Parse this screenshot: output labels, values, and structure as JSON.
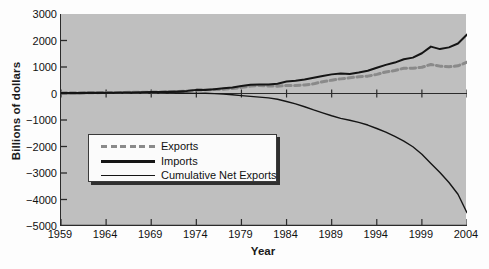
{
  "chart_data": {
    "type": "line",
    "title": "",
    "xlabel": "Year",
    "ylabel": "Billions of dollars",
    "xlim": [
      1959,
      2004
    ],
    "ylim": [
      -5000,
      3000
    ],
    "grid": false,
    "legend_position": "center-left-inside",
    "yticks": [
      3000,
      2000,
      1000,
      0,
      -1000,
      -2000,
      -3000,
      -4000,
      -5000
    ],
    "ytick_labels": [
      "3000",
      "2000",
      "1000",
      "0",
      "−1000",
      "−2000",
      "−3000",
      "−4000",
      "−5000"
    ],
    "xticks": [
      1959,
      1964,
      1969,
      1974,
      1979,
      1984,
      1989,
      1994,
      1999,
      2004
    ],
    "xtick_labels": [
      "1959",
      "1964",
      "1969",
      "1974",
      "1979",
      "1984",
      "1989",
      "1994",
      "1999",
      "2004"
    ],
    "x": [
      1959,
      1960,
      1961,
      1962,
      1963,
      1964,
      1965,
      1966,
      1967,
      1968,
      1969,
      1970,
      1971,
      1972,
      1973,
      1974,
      1975,
      1976,
      1977,
      1978,
      1979,
      1980,
      1981,
      1982,
      1983,
      1984,
      1985,
      1986,
      1987,
      1988,
      1989,
      1990,
      1991,
      1992,
      1993,
      1994,
      1995,
      1996,
      1997,
      1998,
      1999,
      2000,
      2001,
      2002,
      2003,
      2004
    ],
    "series": [
      {
        "name": "Exports",
        "style": "dashed",
        "color": "#8a8a8a",
        "values": [
          21,
          26,
          27,
          29,
          31,
          36,
          38,
          42,
          44,
          49,
          53,
          60,
          64,
          71,
          95,
          127,
          139,
          150,
          159,
          187,
          231,
          281,
          305,
          283,
          277,
          303,
          303,
          321,
          364,
          445,
          504,
          552,
          594,
          633,
          655,
          721,
          813,
          868,
          954,
          953,
          992,
          1096,
          1033,
          1006,
          1046,
          1179
        ]
      },
      {
        "name": "Imports",
        "style": "solid-thick",
        "color": "#151515",
        "values": [
          23,
          23,
          23,
          25,
          27,
          29,
          33,
          38,
          41,
          49,
          54,
          60,
          66,
          79,
          99,
          137,
          133,
          163,
          196,
          229,
          282,
          334,
          343,
          335,
          368,
          456,
          484,
          530,
          594,
          663,
          722,
          759,
          735,
          789,
          858,
          974,
          1081,
          1167,
          1294,
          1354,
          1519,
          1769,
          1676,
          1741,
          1886,
          2224
        ]
      },
      {
        "name": "Cumulative Net Exports",
        "style": "solid-thin",
        "color": "#151515",
        "values": [
          -2,
          -1,
          2,
          6,
          10,
          17,
          22,
          26,
          29,
          29,
          28,
          28,
          26,
          18,
          14,
          4,
          10,
          -3,
          -40,
          -82,
          -133,
          -186,
          -224,
          -276,
          -367,
          -520,
          -701,
          -910,
          -1140,
          -1358,
          -1576,
          -1783,
          -1924,
          -2080,
          -2283,
          -2536,
          -2804,
          -3103,
          -3443,
          -3844,
          -4371,
          -5044,
          -5687,
          -6422,
          -7262,
          -8307
        ],
        "plotted_as": "scaled_cumulative",
        "plotted_values": [
          -2,
          -1,
          2,
          6,
          10,
          17,
          22,
          26,
          29,
          29,
          28,
          28,
          26,
          18,
          14,
          4,
          10,
          -3,
          -25,
          -50,
          -80,
          -110,
          -135,
          -165,
          -215,
          -300,
          -390,
          -500,
          -620,
          -730,
          -840,
          -940,
          -1010,
          -1090,
          -1190,
          -1320,
          -1460,
          -1620,
          -1800,
          -2010,
          -2290,
          -2640,
          -2980,
          -3360,
          -3800,
          -4500
        ]
      }
    ]
  },
  "legend": {
    "entries": [
      {
        "label": "Exports",
        "key": "dashed-gray-line"
      },
      {
        "label": "Imports",
        "key": "thick-black-line"
      },
      {
        "label": "Cumulative Net Exports",
        "key": "thin-black-line"
      }
    ]
  },
  "colors": {
    "plot_background": "#bfbfbf",
    "figure_background": "#fdfdfd",
    "axis": "#2b2b2b",
    "exports": "#8a8a8a",
    "imports": "#151515",
    "cumulative": "#151515"
  }
}
